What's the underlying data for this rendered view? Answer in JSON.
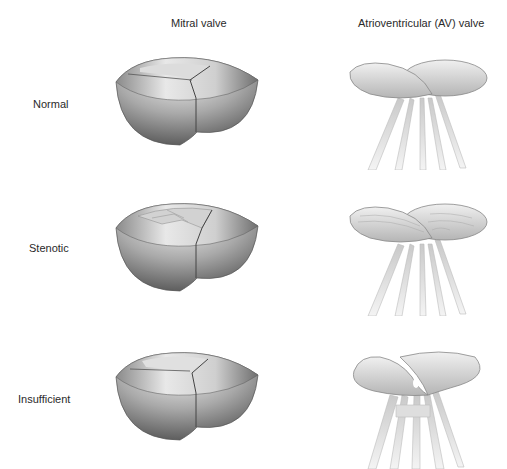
{
  "columns": [
    {
      "title": "Mitral valve"
    },
    {
      "title": "Atrioventricular (AV) valve"
    }
  ],
  "rows": [
    {
      "label": "Normal"
    },
    {
      "label": "Stenotic"
    },
    {
      "label": "Insufficient"
    }
  ],
  "colors": {
    "background": "#ffffff",
    "valve_light": "#e6e6e6",
    "valve_mid": "#b8b8b8",
    "valve_dark": "#6e6e6e",
    "leaflet_light": "#eeeeee",
    "chordae": "#d4d4d4"
  }
}
